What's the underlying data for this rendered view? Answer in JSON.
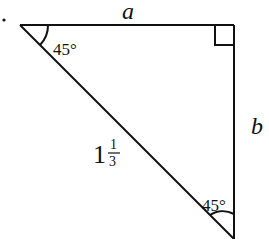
{
  "diagram": {
    "type": "right-triangle",
    "bullet": "•",
    "sides": {
      "top": "a",
      "right": "b",
      "hypotenuse_whole": "1",
      "hypotenuse_num": "1",
      "hypotenuse_den": "3"
    },
    "angles": {
      "top_left": "45°",
      "bottom_right": "45°",
      "top_right": "right-angle"
    },
    "stroke_color": "#111111"
  }
}
